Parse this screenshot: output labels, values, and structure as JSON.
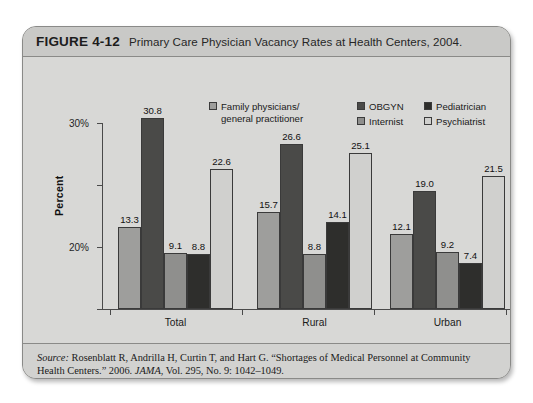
{
  "figure": {
    "number": "FIGURE 4-12",
    "title": "Primary Care Physician Vacancy Rates at Health Centers, 2004."
  },
  "source": {
    "label": "Source:",
    "text_before_journal": " Rosenblatt R, Andrilla H, Curtin T, and Hart G. “Shortages of Medical Personnel at Community Health Centers.” 2006. ",
    "journal": "JAMA",
    "text_after_journal": ", Vol. 295, No. 9: 1042–1049."
  },
  "chart_data": {
    "type": "bar",
    "title": "Primary Care Physician Vacancy Rates at Health Centers, 2004.",
    "xlabel": "",
    "ylabel": "Percent",
    "ylim": [
      0,
      30
    ],
    "yticks": [
      0,
      10,
      20,
      30
    ],
    "ytick_labels": [
      "0",
      "10%",
      "20%",
      "30%"
    ],
    "grid": false,
    "legend_position": "top-center",
    "categories": [
      "Total",
      "Rural",
      "Urban"
    ],
    "series": [
      {
        "name": "Family physicians/general practitioner",
        "color": "#9e9e9c",
        "values": [
          13.3,
          15.7,
          12.1
        ],
        "labels": [
          "13.3",
          "15.7",
          "12.1"
        ]
      },
      {
        "name": "OBGYN",
        "color": "#4a4a48",
        "values": [
          30.8,
          26.6,
          19.0
        ],
        "labels": [
          "30.8",
          "26.6",
          "19.0"
        ]
      },
      {
        "name": "Internist",
        "color": "#8f8f8d",
        "values": [
          9.1,
          8.8,
          9.2
        ],
        "labels": [
          "9.1",
          "8.8",
          "9.2"
        ]
      },
      {
        "name": "Pediatrician",
        "color": "#2e2e2c",
        "values": [
          8.8,
          14.1,
          7.4
        ],
        "labels": [
          "8.8",
          "14.1",
          "7.4"
        ]
      },
      {
        "name": "Psychiatrist",
        "color": "#d0d0ce",
        "values": [
          22.6,
          25.1,
          21.5
        ],
        "labels": [
          "22.6",
          "25.1",
          "21.5"
        ]
      }
    ]
  },
  "legend": {
    "entries": [
      {
        "label_line1": "Family physicians/",
        "label_line2": "general practitioner",
        "color": "#9e9e9c"
      },
      {
        "label_line1": "OBGYN",
        "label_line2": "",
        "color": "#4a4a48"
      },
      {
        "label_line1": "Internist",
        "label_line2": "",
        "color": "#8f8f8d"
      },
      {
        "label_line1": "Pediatrician",
        "label_line2": "",
        "color": "#2e2e2c"
      },
      {
        "label_line1": "Psychiatrist",
        "label_line2": "",
        "color": "#d0d0ce"
      }
    ]
  }
}
